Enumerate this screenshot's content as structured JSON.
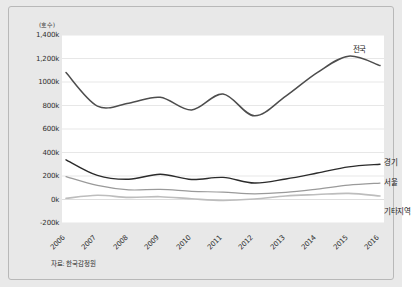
{
  "chart_data": {
    "type": "line",
    "title": "",
    "subtitle": "",
    "xlabel": "",
    "ylabel": "",
    "unit_label": "(호수)",
    "source_note": "자료: 한국감정원",
    "grid": true,
    "legend_position": "right-inline",
    "x": [
      2006,
      2007,
      2008,
      2009,
      2010,
      2011,
      2012,
      2013,
      2014,
      2015,
      2016
    ],
    "xtick_labels": [
      "2006",
      "2007",
      "2008",
      "2009",
      "2010",
      "2011",
      "2012",
      "2013",
      "2014",
      "2015",
      "2016"
    ],
    "ylim": [
      -200000,
      1400000
    ],
    "ytick_values": [
      1400000,
      1200000,
      1000000,
      800000,
      600000,
      400000,
      200000,
      0,
      -200000
    ],
    "ytick_labels": [
      "1,400k",
      "1,200k",
      "1000k",
      "800k",
      "600k",
      "400k",
      "200k",
      "0k",
      "-200k"
    ],
    "series": [
      {
        "name": "전국",
        "color": "#4d4d4d",
        "width": 1.5,
        "label_x": 2015,
        "values": [
          1080000,
          795000,
          820000,
          870000,
          762000,
          898000,
          712000,
          880000,
          1080000,
          1220000,
          1140000
        ]
      },
      {
        "name": "경기",
        "color": "#2b2b2b",
        "width": 1.4,
        "label_x": 2016,
        "values": [
          338000,
          205000,
          172000,
          215000,
          170000,
          188000,
          140000,
          175000,
          225000,
          278000,
          300000
        ]
      },
      {
        "name": "서울",
        "color": "#9a9a9a",
        "width": 1.2,
        "label_x": 2016,
        "values": [
          195000,
          120000,
          82000,
          86000,
          70000,
          62000,
          48000,
          60000,
          88000,
          122000,
          140000
        ]
      },
      {
        "name": "기타지역",
        "color": "#bdbdbd",
        "width": 1.6,
        "label_x": 2016,
        "values": [
          10000,
          36000,
          18000,
          24000,
          6000,
          -8000,
          4000,
          30000,
          42000,
          52000,
          30000
        ]
      }
    ]
  }
}
